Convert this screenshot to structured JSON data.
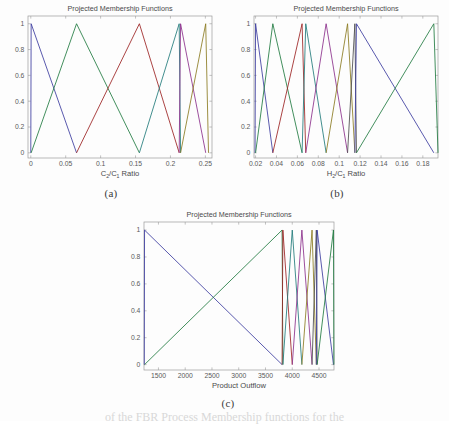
{
  "page": {
    "background_color": "#fdfdfd",
    "bottom_cropped_text": "of the FBR Process Membership functions for the"
  },
  "panels": [
    {
      "id": "a",
      "caption": "(a)",
      "title": "Projected Membership Functions",
      "xlabel_main": "C",
      "xlabel_sub1": "2",
      "xlabel_mid": "/C",
      "xlabel_sub2": "1",
      "xlabel_tail": " Ratio",
      "xlabel_plain": "C2/C1 Ratio"
    },
    {
      "id": "b",
      "caption": "(b)",
      "title": "Projected Membership Functions",
      "xlabel_main": "H",
      "xlabel_sub1": "2",
      "xlabel_mid": "/C",
      "xlabel_sub2": "1",
      "xlabel_tail": " Ratio",
      "xlabel_plain": "H2/C1 Ratio"
    },
    {
      "id": "c",
      "caption": "(c)",
      "title": "Projected Membership Functions",
      "xlabel_main": "Product Outflow",
      "xlabel_sub1": "",
      "xlabel_mid": "",
      "xlabel_sub2": "",
      "xlabel_tail": "",
      "xlabel_plain": "Product Outflow"
    }
  ],
  "chart_data": [
    {
      "type": "line",
      "panel": "a",
      "title": "Projected Membership Functions",
      "xlabel": "C2/C1 Ratio",
      "ylabel": "",
      "xlim": [
        -0.004,
        0.2595
      ],
      "ylim": [
        -0.04,
        1.06
      ],
      "xticks": [
        0,
        0.05,
        0.1,
        0.15,
        0.2,
        0.25
      ],
      "xtick_labels": [
        "0",
        "0.05",
        "0.1",
        "0.15",
        "0.2",
        "0.25"
      ],
      "yticks": [
        0,
        0.2,
        0.4,
        0.6,
        0.8,
        1
      ],
      "ytick_labels": [
        "0",
        "0.2",
        "0.4",
        "0.6",
        "0.8",
        "1"
      ],
      "grid": false,
      "legend": "none",
      "series": [
        {
          "name": "mf1",
          "color": "#3a3a9e",
          "x": [
            0,
            0.0005,
            0.0655
          ],
          "y": [
            0,
            1,
            0
          ]
        },
        {
          "name": "mf2",
          "color": "#1f7a3f",
          "x": [
            0.0005,
            0.0655,
            0.1555
          ],
          "y": [
            0,
            1,
            0
          ]
        },
        {
          "name": "mf3",
          "color": "#9b2020",
          "x": [
            0.0655,
            0.1555,
            0.2125
          ],
          "y": [
            0,
            1,
            0
          ]
        },
        {
          "name": "mf4",
          "color": "#1f7a7a",
          "x": [
            0.1555,
            0.2125,
            0.2145
          ],
          "y": [
            0,
            1,
            0
          ]
        },
        {
          "name": "mf5",
          "color": "#8a2d8a",
          "x": [
            0.2125,
            0.2145,
            0.2505
          ],
          "y": [
            0,
            1,
            0
          ]
        },
        {
          "name": "mf6",
          "color": "#8a7a1f",
          "x": [
            0.2145,
            0.2505,
            0.2545
          ],
          "y": [
            0,
            1,
            0
          ]
        }
      ]
    },
    {
      "type": "line",
      "panel": "b",
      "title": "Projected Membership Functions",
      "xlabel": "H2/C1 Ratio",
      "ylabel": "",
      "xlim": [
        0.0185,
        0.1945
      ],
      "ylim": [
        -0.04,
        1.06
      ],
      "xticks": [
        0.02,
        0.04,
        0.06,
        0.08,
        0.1,
        0.12,
        0.14,
        0.16,
        0.18
      ],
      "xtick_labels": [
        "0.02",
        "0.04",
        "0.06",
        "0.08",
        "0.1",
        "0.12",
        "0.14",
        "0.16",
        "0.18"
      ],
      "yticks": [
        0,
        0.2,
        0.4,
        0.6,
        0.8,
        1
      ],
      "ytick_labels": [
        "0",
        "0.2",
        "0.4",
        "0.6",
        "0.8",
        "1"
      ],
      "grid": false,
      "legend": "none",
      "series": [
        {
          "name": "mf1",
          "color": "#3a3a9e",
          "x": [
            0.0195,
            0.02,
            0.0365
          ],
          "y": [
            0,
            1,
            0
          ]
        },
        {
          "name": "mf2",
          "color": "#1f7a3f",
          "x": [
            0.02,
            0.0365,
            0.0645
          ],
          "y": [
            0,
            1,
            0
          ]
        },
        {
          "name": "mf3",
          "color": "#9b2020",
          "x": [
            0.0365,
            0.0645,
            0.068
          ],
          "y": [
            0,
            1,
            0
          ]
        },
        {
          "name": "mf4",
          "color": "#1f7a7a",
          "x": [
            0.0645,
            0.068,
            0.0875
          ],
          "y": [
            0,
            1,
            0
          ]
        },
        {
          "name": "mf5",
          "color": "#8a2d8a",
          "x": [
            0.068,
            0.0875,
            0.108
          ],
          "y": [
            0,
            1,
            0
          ]
        },
        {
          "name": "mf6",
          "color": "#8a7a1f",
          "x": [
            0.0875,
            0.108,
            0.115
          ],
          "y": [
            0,
            1,
            0
          ]
        },
        {
          "name": "mf7",
          "color": "#4a4a4a",
          "x": [
            0.108,
            0.115,
            0.1165
          ],
          "y": [
            0,
            1,
            0
          ]
        },
        {
          "name": "mf8",
          "color": "#3a3a9e",
          "x": [
            0.115,
            0.1165,
            0.1905
          ],
          "y": [
            0,
            1,
            0
          ]
        },
        {
          "name": "mf9",
          "color": "#1f7a3f",
          "x": [
            0.1165,
            0.1905,
            0.1945
          ],
          "y": [
            0,
            1,
            0
          ]
        }
      ]
    },
    {
      "type": "line",
      "panel": "c",
      "title": "Projected Membership Functions",
      "xlabel": "Product Outflow",
      "ylabel": "",
      "xlim": [
        1230,
        4780
      ],
      "ylim": [
        -0.04,
        1.06
      ],
      "xticks": [
        1500,
        2000,
        2500,
        3000,
        3500,
        4000,
        4500
      ],
      "xtick_labels": [
        "1500",
        "2000",
        "2500",
        "3000",
        "3500",
        "4000",
        "4500"
      ],
      "yticks": [
        0,
        0.2,
        0.4,
        0.6,
        0.8,
        1
      ],
      "ytick_labels": [
        "0",
        "0.2",
        "0.4",
        "0.6",
        "0.8",
        "1"
      ],
      "grid": false,
      "legend": "none",
      "series": [
        {
          "name": "mf1",
          "color": "#3a3a9e",
          "x": [
            1235,
            1240,
            3810
          ],
          "y": [
            0,
            1,
            0
          ]
        },
        {
          "name": "mf2",
          "color": "#1f7a3f",
          "x": [
            1240,
            3810,
            3825
          ],
          "y": [
            0,
            1,
            0
          ]
        },
        {
          "name": "mf3",
          "color": "#9b2020",
          "x": [
            3810,
            3825,
            4000
          ],
          "y": [
            0,
            1,
            0
          ]
        },
        {
          "name": "mf4",
          "color": "#1f7a7a",
          "x": [
            3825,
            4000,
            4180
          ],
          "y": [
            0,
            1,
            0
          ]
        },
        {
          "name": "mf5",
          "color": "#8a2d8a",
          "x": [
            4000,
            4180,
            4370
          ],
          "y": [
            0,
            1,
            0
          ]
        },
        {
          "name": "mf6",
          "color": "#8a7a1f",
          "x": [
            4180,
            4370,
            4450
          ],
          "y": [
            0,
            1,
            0
          ]
        },
        {
          "name": "mf7",
          "color": "#4a4a4a",
          "x": [
            4370,
            4450,
            4465
          ],
          "y": [
            0,
            1,
            0
          ]
        },
        {
          "name": "mf8",
          "color": "#3a3a9e",
          "x": [
            4450,
            4465,
            4770
          ],
          "y": [
            0,
            1,
            0
          ]
        },
        {
          "name": "mf9",
          "color": "#1f7a3f",
          "x": [
            4465,
            4770,
            4778
          ],
          "y": [
            0,
            1,
            0
          ]
        }
      ]
    }
  ]
}
